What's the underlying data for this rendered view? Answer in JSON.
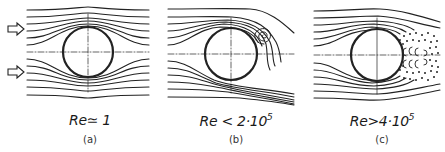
{
  "figure": {
    "stroke_color": "#222222",
    "background": "#ffffff",
    "flow_direction": "left-to-right",
    "inflow_arrows": [
      {
        "x": 8,
        "y": 29
      },
      {
        "x": 8,
        "y": 72
      }
    ],
    "panels": [
      {
        "id": "a",
        "caption": "(a)",
        "re_label": "Re ≃ 1",
        "re_text": "Re≃ 1",
        "regime": "creeping (Stokes) flow, symmetric streamlines",
        "x_range": [
          25,
          150
        ],
        "cylinder": {
          "cx": 88,
          "cy": 52,
          "r": 25
        },
        "label_x": 90
      },
      {
        "id": "b",
        "caption": "(b)",
        "re_label": "Re < 2·10^5",
        "re_text_base": "Re < 2·10",
        "re_exponent": "5",
        "regime": "laminar separation with vortex shedding",
        "x_range": [
          167,
          295
        ],
        "cylinder": {
          "cx": 231,
          "cy": 54,
          "r": 26
        },
        "label_x": 236
      },
      {
        "id": "c",
        "caption": "(c)",
        "re_label": "Re > 4·10^5",
        "re_text_base": "Re>4·10",
        "re_exponent": "5",
        "regime": "turbulent wake, delayed separation",
        "x_range": [
          313,
          440
        ],
        "cylinder": {
          "cx": 377,
          "cy": 55,
          "r": 26
        },
        "label_x": 382
      }
    ]
  }
}
